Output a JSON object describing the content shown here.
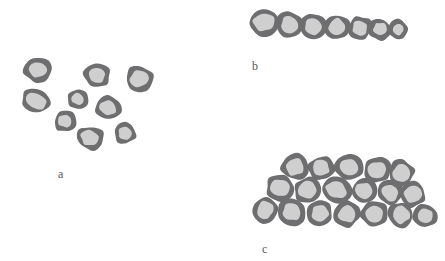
{
  "figure": {
    "title": "",
    "background_color": "#ffffff",
    "width": 445,
    "height": 261
  },
  "style": {
    "cell_wall_color": "#6e6e70",
    "cell_fill_color": "#cfcfcf",
    "label_color": "#58585a"
  },
  "panels": [
    {
      "id": "a",
      "label": "a",
      "description": "scattered single cells",
      "label_x": 58,
      "label_y": 168,
      "cell_count": 9,
      "cells": [
        {
          "cx": 38,
          "cy": 70,
          "rx": 14,
          "ry": 12,
          "rot": -10
        },
        {
          "cx": 97,
          "cy": 75,
          "rx": 13,
          "ry": 12,
          "rot": 8
        },
        {
          "cx": 139,
          "cy": 79,
          "rx": 14,
          "ry": 13,
          "rot": -18
        },
        {
          "cx": 36,
          "cy": 101,
          "rx": 15,
          "ry": 12,
          "rot": 12
        },
        {
          "cx": 78,
          "cy": 99,
          "rx": 11,
          "ry": 10,
          "rot": -5
        },
        {
          "cx": 108,
          "cy": 108,
          "rx": 13,
          "ry": 12,
          "rot": 15
        },
        {
          "cx": 65,
          "cy": 121,
          "rx": 11,
          "ry": 11,
          "rot": -12
        },
        {
          "cx": 90,
          "cy": 138,
          "rx": 14,
          "ry": 12,
          "rot": 5
        },
        {
          "cx": 125,
          "cy": 133,
          "rx": 11,
          "ry": 11,
          "rot": 20
        }
      ]
    },
    {
      "id": "b",
      "label": "b",
      "description": "single linear chain of cells",
      "label_x": 252,
      "label_y": 60,
      "cell_count": 7,
      "cells": [
        {
          "cx": 264,
          "cy": 22,
          "rx": 15,
          "ry": 14,
          "rot": -8
        },
        {
          "cx": 290,
          "cy": 25,
          "rx": 14,
          "ry": 13,
          "rot": 6
        },
        {
          "cx": 313,
          "cy": 26,
          "rx": 13,
          "ry": 13,
          "rot": -6
        },
        {
          "cx": 337,
          "cy": 27,
          "rx": 13,
          "ry": 13,
          "rot": 10
        },
        {
          "cx": 360,
          "cy": 28,
          "rx": 12,
          "ry": 12,
          "rot": -4
        },
        {
          "cx": 380,
          "cy": 29,
          "rx": 11,
          "ry": 11,
          "rot": 8
        },
        {
          "cx": 398,
          "cy": 30,
          "rx": 10,
          "ry": 10,
          "rot": -10
        }
      ]
    },
    {
      "id": "c",
      "label": "c",
      "description": "dense multi-layered cluster of cells",
      "label_x": 262,
      "label_y": 243,
      "cell_count": 18,
      "rows": [
        {
          "name": "top",
          "cells": [
            {
              "cx": 295,
              "cy": 167,
              "rx": 14,
              "ry": 13,
              "rot": -8
            },
            {
              "cx": 321,
              "cy": 168,
              "rx": 13,
              "ry": 12,
              "rot": 10
            },
            {
              "cx": 349,
              "cy": 167,
              "rx": 14,
              "ry": 12,
              "rot": -5
            },
            {
              "cx": 377,
              "cy": 170,
              "rx": 14,
              "ry": 13,
              "rot": 7
            },
            {
              "cx": 401,
              "cy": 173,
              "rx": 13,
              "ry": 13,
              "rot": -12
            }
          ]
        },
        {
          "name": "middle",
          "cells": [
            {
              "cx": 280,
              "cy": 188,
              "rx": 14,
              "ry": 13,
              "rot": 6
            },
            {
              "cx": 308,
              "cy": 190,
              "rx": 14,
              "ry": 13,
              "rot": -9
            },
            {
              "cx": 336,
              "cy": 190,
              "rx": 15,
              "ry": 13,
              "rot": 4
            },
            {
              "cx": 364,
              "cy": 191,
              "rx": 13,
              "ry": 13,
              "rot": -6
            },
            {
              "cx": 390,
              "cy": 193,
              "rx": 13,
              "ry": 12,
              "rot": 11
            },
            {
              "cx": 413,
              "cy": 194,
              "rx": 13,
              "ry": 13,
              "rot": -7
            }
          ]
        },
        {
          "name": "bottom",
          "cells": [
            {
              "cx": 265,
              "cy": 210,
              "rx": 13,
              "ry": 13,
              "rot": -10
            },
            {
              "cx": 292,
              "cy": 212,
              "rx": 14,
              "ry": 13,
              "rot": 5
            },
            {
              "cx": 320,
              "cy": 213,
              "rx": 13,
              "ry": 13,
              "rot": -6
            },
            {
              "cx": 347,
              "cy": 214,
              "rx": 13,
              "ry": 13,
              "rot": 9
            },
            {
              "cx": 374,
              "cy": 214,
              "rx": 14,
              "ry": 13,
              "rot": -4
            },
            {
              "cx": 401,
              "cy": 215,
              "rx": 13,
              "ry": 13,
              "rot": 7
            },
            {
              "cx": 425,
              "cy": 216,
              "rx": 12,
              "ry": 12,
              "rot": -9
            }
          ]
        }
      ]
    }
  ]
}
